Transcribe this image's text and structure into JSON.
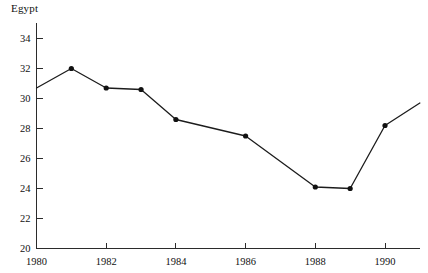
{
  "chart_data": {
    "type": "line",
    "title": "Egypt",
    "xlabel": "",
    "ylabel": "",
    "x": [
      1980,
      1981,
      1982,
      1983,
      1984,
      1986,
      1988,
      1989,
      1990,
      1991
    ],
    "values": [
      30.7,
      32.0,
      30.7,
      30.6,
      28.6,
      27.5,
      24.1,
      24.0,
      28.2,
      29.7
    ],
    "series": [
      {
        "name": "Egypt",
        "x": [
          1980,
          1981,
          1982,
          1983,
          1984,
          1986,
          1988,
          1989,
          1990,
          1991
        ],
        "values": [
          30.7,
          32.0,
          30.7,
          30.6,
          28.6,
          27.5,
          24.1,
          24.0,
          28.2,
          29.7
        ],
        "markers": [
          false,
          true,
          true,
          true,
          true,
          true,
          true,
          true,
          true,
          false
        ]
      }
    ],
    "xlim": [
      1980,
      1991.0
    ],
    "ylim": [
      20,
      35
    ],
    "yticks": [
      20,
      22,
      24,
      26,
      28,
      30,
      32,
      34
    ],
    "ytick_labels": [
      "20",
      "22",
      "24",
      "26",
      "28",
      "30",
      "32",
      "34"
    ],
    "xticks": [
      1980,
      1982,
      1984,
      1986,
      1988,
      1990
    ],
    "xtick_labels": [
      "1980",
      "1982",
      "1984",
      "1986",
      "1988",
      "1990"
    ],
    "grid": false,
    "legend": false,
    "legend_position": "none",
    "marker_style": "filled-circle",
    "line_color": "#1c1c1c",
    "marker_color": "#111111",
    "axis_color": "#2b2b2b",
    "background_color": "#ffffff"
  }
}
